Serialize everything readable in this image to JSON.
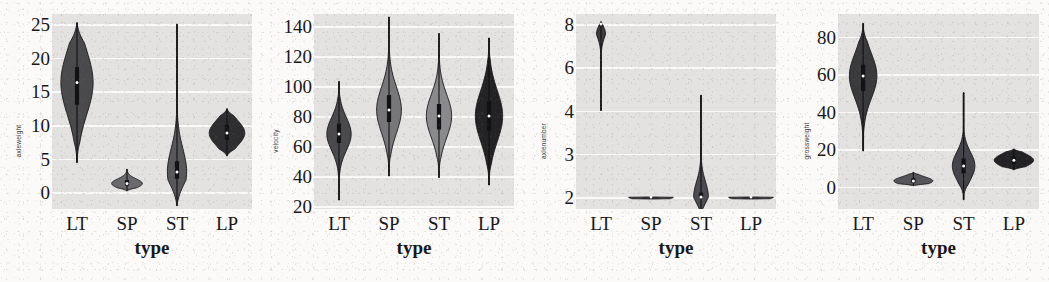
{
  "figure": {
    "panel_count": 4,
    "background_color": "#fbfaf8",
    "plot_background_color": "#e4e2e0",
    "gridline_color": "#fbfbfb"
  },
  "chart_data": [
    {
      "type": "violin",
      "title": "",
      "xlabel": "type",
      "ylabel": "axleweight",
      "categories": [
        "LT",
        "SP",
        "ST",
        "LP"
      ],
      "yticks": [
        0,
        5,
        10,
        15,
        20,
        25
      ],
      "ytick_labels": [
        "0",
        "5",
        "10",
        "15",
        "20",
        "25"
      ],
      "ylim": [
        -2.5,
        26.5
      ],
      "grid": true,
      "legend": "none",
      "series": [
        {
          "name": "LT",
          "min": 4.4,
          "q1": 13.0,
          "median": 16.3,
          "q3": 18.6,
          "max": 25.2,
          "fill": "#4a4a4c"
        },
        {
          "name": "SP",
          "min": 0.2,
          "q1": 1.0,
          "median": 1.3,
          "q3": 1.8,
          "max": 3.4,
          "fill": "#6a6a6c"
        },
        {
          "name": "ST",
          "min": -2.0,
          "q1": 2.0,
          "median": 3.0,
          "q3": 4.6,
          "max": 25.0,
          "fill": "#58585a"
        },
        {
          "name": "LP",
          "min": 5.4,
          "q1": 7.8,
          "median": 8.8,
          "q3": 10.0,
          "max": 12.4,
          "fill": "#2e2e30"
        }
      ]
    },
    {
      "type": "violin",
      "title": "",
      "xlabel": "type",
      "ylabel": "velocity",
      "categories": [
        "LT",
        "SP",
        "ST",
        "LP"
      ],
      "yticks": [
        20,
        40,
        60,
        80,
        100,
        120,
        140
      ],
      "ytick_labels": [
        "20",
        "40",
        "60",
        "80",
        "100",
        "120",
        "140"
      ],
      "ylim": [
        18,
        148
      ],
      "grid": true,
      "legend": "none",
      "series": [
        {
          "name": "LT",
          "min": 24,
          "q1": 62,
          "median": 68,
          "q3": 75,
          "max": 103,
          "fill": "#4a4a4c"
        },
        {
          "name": "SP",
          "min": 40,
          "q1": 76,
          "median": 84,
          "q3": 94,
          "max": 146,
          "fill": "#77777a"
        },
        {
          "name": "ST",
          "min": 39,
          "q1": 71,
          "median": 80,
          "q3": 88,
          "max": 135,
          "fill": "#8a8a8d"
        },
        {
          "name": "LP",
          "min": 34,
          "q1": 70,
          "median": 80,
          "q3": 90,
          "max": 132,
          "fill": "#232325"
        }
      ]
    },
    {
      "type": "violin",
      "title": "",
      "xlabel": "type",
      "ylabel": "axlenumber",
      "categories": [
        "LT",
        "SP",
        "ST",
        "LP"
      ],
      "yticks": [
        2,
        3,
        4,
        6,
        8
      ],
      "ytick_labels": [
        "2",
        "3",
        "4",
        "6",
        "8"
      ],
      "ylim": [
        1.4,
        8.4
      ],
      "nonlinear_axis": true,
      "grid": true,
      "legend": "none",
      "series": [
        {
          "name": "LT",
          "min": 4.0,
          "q1": 7.9,
          "median": 8.0,
          "q3": 8.0,
          "max": 8.1,
          "fill": "#3c3c3e"
        },
        {
          "name": "SP",
          "min": 2.0,
          "q1": 2.0,
          "median": 2.0,
          "q3": 2.0,
          "max": 2.0,
          "fill": "#46464a"
        },
        {
          "name": "ST",
          "min": 1.6,
          "q1": 2.0,
          "median": 2.0,
          "q3": 2.1,
          "max": 4.7,
          "fill": "#4c4c50"
        },
        {
          "name": "LP",
          "min": 2.0,
          "q1": 2.0,
          "median": 2.0,
          "q3": 2.0,
          "max": 2.0,
          "fill": "#46464a"
        }
      ]
    },
    {
      "type": "violin",
      "title": "",
      "xlabel": "type",
      "ylabel": "grossweight",
      "categories": [
        "LT",
        "SP",
        "ST",
        "LP"
      ],
      "yticks": [
        0,
        20,
        40,
        60,
        80
      ],
      "ytick_labels": [
        "0",
        "20",
        "40",
        "60",
        "80"
      ],
      "ylim": [
        -12,
        92
      ],
      "grid": true,
      "legend": "none",
      "series": [
        {
          "name": "LT",
          "min": 19,
          "q1": 51,
          "median": 59,
          "q3": 65,
          "max": 87,
          "fill": "#3a3a3c"
        },
        {
          "name": "SP",
          "min": 0.5,
          "q1": 2.0,
          "median": 3.0,
          "q3": 4.5,
          "max": 7.5,
          "fill": "#56565a"
        },
        {
          "name": "ST",
          "min": -7,
          "q1": 7,
          "median": 11,
          "q3": 15,
          "max": 50,
          "fill": "#44444a"
        },
        {
          "name": "LP",
          "min": 9,
          "q1": 12,
          "median": 14,
          "q3": 16,
          "max": 20,
          "fill": "#232325"
        }
      ]
    }
  ]
}
